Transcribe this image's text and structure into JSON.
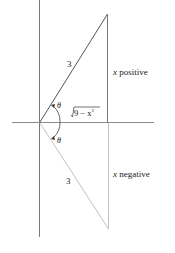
{
  "diagram": {
    "upper_triangle": {
      "hypotenuse_label": "3",
      "angle_label": "θ",
      "adjacent_label": "√(9 − x²)",
      "adjacent_radicand": "9 − x",
      "adjacent_exponent": "2",
      "side_label_var": "x",
      "side_label_text": "positive"
    },
    "lower_triangle": {
      "hypotenuse_label": "3",
      "angle_label": "θ",
      "side_label_var": "x",
      "side_label_text": "negative"
    },
    "colors": {
      "axis": "#8a8a8a",
      "upper_triangle": "#555555",
      "lower_triangle": "#bdbdbd",
      "text": "#222222"
    }
  }
}
